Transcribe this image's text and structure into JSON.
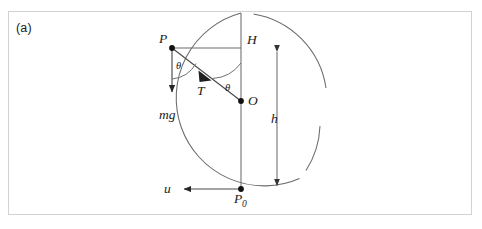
{
  "figure": {
    "panel_label": "(a)",
    "frame_color": "#d2d2d2",
    "stroke_color": "#595959",
    "label_color": "#1a1a1a"
  },
  "points": [
    {
      "id": "P",
      "label": "P",
      "sub": "",
      "x": 172,
      "y": 48,
      "label_x": 159,
      "label_y": 43
    },
    {
      "id": "H",
      "label": "H",
      "sub": "",
      "x": 241,
      "y": 48,
      "label_x": 247,
      "label_y": 44
    },
    {
      "id": "O",
      "label": "O",
      "sub": "",
      "x": 241,
      "y": 101,
      "label_x": 248,
      "label_y": 105
    },
    {
      "id": "P0",
      "label": "P",
      "sub": "0",
      "x": 241,
      "y": 189,
      "label_x": 236,
      "label_y": 203
    }
  ],
  "circle": {
    "center_x": 241,
    "center_y": 101,
    "radius": 88,
    "gap_note": "arc broken near top-right"
  },
  "vectors": [
    {
      "id": "mg",
      "label": "mg",
      "label_x": 160,
      "label_y": 119,
      "from_x": 172,
      "from_y": 48,
      "to_x": 172,
      "to_y": 98
    },
    {
      "id": "T",
      "label": "T",
      "label_x": 199,
      "label_y": 94,
      "from_x": 172,
      "from_y": 48,
      "to_x": 241,
      "to_y": 101
    },
    {
      "id": "u",
      "label": "u",
      "label_x": 166,
      "label_y": 193,
      "from_x": 241,
      "from_y": 189,
      "to_x": 178,
      "to_y": 189
    },
    {
      "id": "h",
      "label": "h",
      "label_x": 272,
      "label_y": 122,
      "from_x": 277,
      "from_y": 46,
      "to_x": 277,
      "to_y": 192
    }
  ],
  "angles": [
    {
      "id": "theta-at-P",
      "label": "θ",
      "label_x": 176,
      "label_y": 68,
      "vertex_x": 172,
      "vertex_y": 48
    },
    {
      "id": "theta-at-O",
      "label": "θ",
      "label_x": 227,
      "label_y": 90,
      "vertex_x": 241,
      "vertex_y": 101
    }
  ],
  "segments": [
    {
      "id": "PH",
      "from_x": 172,
      "from_y": 48,
      "to_x": 241,
      "to_y": 48
    },
    {
      "id": "vertical-axis",
      "from_x": 241,
      "from_y": 13,
      "to_x": 241,
      "to_y": 189
    }
  ]
}
